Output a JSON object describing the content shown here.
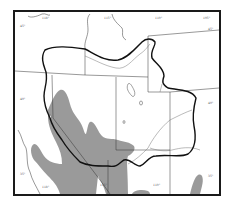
{
  "map": {
    "type": "regional outline map",
    "colors": {
      "frame": "#1a1a1a",
      "shaded_region": "#9a9a9a",
      "outline_region": "#111111",
      "boundaries": "#333333",
      "rivers": "#777777",
      "background": "#ffffff"
    },
    "graticule_labels": {
      "top": [
        "118°",
        "115°",
        "110°",
        "105°"
      ],
      "bottom": [
        "118°",
        "115°",
        "110°"
      ],
      "left": [
        "45°",
        "40°",
        "35°"
      ],
      "right": [
        "45°",
        "40°",
        "35°"
      ]
    }
  }
}
